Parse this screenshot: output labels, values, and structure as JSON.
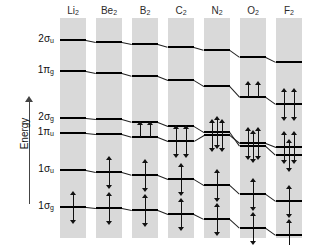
{
  "figure": {
    "kind": "molecular-orbital-correlation-diagram",
    "axis": {
      "label": "Energy",
      "direction": "increasing-upward"
    }
  },
  "chart_data": {
    "type": "line",
    "xlabel": "",
    "ylabel": "Energy",
    "grid": false,
    "legend": "none",
    "categories": [
      "Li2",
      "Be2",
      "B2",
      "C2",
      "N2",
      "O2",
      "F2"
    ],
    "category_labels": [
      {
        "symbol": "Li",
        "sub": "2"
      },
      {
        "symbol": "Be",
        "sub": "2"
      },
      {
        "symbol": "B",
        "sub": "2"
      },
      {
        "symbol": "C",
        "sub": "2"
      },
      {
        "symbol": "N",
        "sub": "2"
      },
      {
        "symbol": "O",
        "sub": "2"
      },
      {
        "symbol": "F",
        "sub": "2"
      }
    ],
    "orbital_labels": [
      {
        "id": "2su",
        "base": "2σ",
        "sub": "u"
      },
      {
        "id": "1pg",
        "base": "1π",
        "sub": "g"
      },
      {
        "id": "2sg",
        "base": "2σ",
        "sub": "g"
      },
      {
        "id": "1pu",
        "base": "1π",
        "sub": "u"
      },
      {
        "id": "1su",
        "base": "1σ",
        "sub": "u"
      },
      {
        "id": "1sg",
        "base": "1σ",
        "sub": "g"
      }
    ],
    "series": [
      {
        "name": "2σu",
        "values": [
          40,
          42,
          44,
          47,
          50,
          57,
          62
        ],
        "electrons": [
          0,
          0,
          0,
          0,
          0,
          0,
          0
        ],
        "degeneracy": 1
      },
      {
        "name": "1πg",
        "values": [
          71,
          73,
          76,
          80,
          86,
          97,
          104
        ],
        "electrons": [
          0,
          0,
          0,
          0,
          0,
          2,
          4
        ],
        "degeneracy": 2
      },
      {
        "name": "2σg",
        "values": [
          118,
          119,
          122,
          126,
          132,
          146,
          155
        ],
        "electrons": [
          0,
          0,
          0,
          0,
          2,
          2,
          2
        ],
        "degeneracy": 1
      },
      {
        "name": "1πu",
        "values": [
          133,
          134,
          137,
          141,
          135,
          143,
          147
        ],
        "electrons": [
          0,
          0,
          2,
          4,
          4,
          4,
          4
        ],
        "degeneracy": 2
      },
      {
        "name": "1σu",
        "values": [
          170,
          172,
          175,
          179,
          185,
          194,
          201
        ],
        "electrons": [
          0,
          2,
          2,
          2,
          2,
          2,
          2
        ],
        "degeneracy": 1
      },
      {
        "name": "1σg",
        "values": [
          207,
          208,
          210,
          214,
          219,
          228,
          235
        ],
        "electrons": [
          2,
          2,
          2,
          2,
          2,
          2,
          2
        ],
        "degeneracy": 1
      }
    ],
    "notes": {
      "crossing": "2σg and 1πu cross between N2 and O2",
      "o2_unpaired": "O2 has two unpaired electrons in the degenerate 1πg pair"
    }
  },
  "colors": {
    "band": "#d9d9d9",
    "level": "#000000",
    "link": "#222222",
    "text": "#111111",
    "background": "#ffffff"
  }
}
